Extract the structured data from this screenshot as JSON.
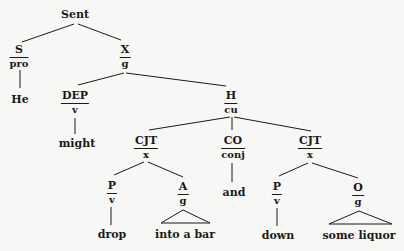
{
  "tree": {
    "root": "Sent",
    "nodes": {
      "s": {
        "function": "S",
        "category": "pro",
        "word": "He"
      },
      "x": {
        "function": "X",
        "category": "g"
      },
      "dep": {
        "function": "DEP",
        "category": "v",
        "word": "might"
      },
      "h": {
        "function": "H",
        "category": "cu"
      },
      "cjt1": {
        "function": "CJT",
        "category": "x"
      },
      "co": {
        "function": "CO",
        "category": "conj",
        "word": "and"
      },
      "cjt2": {
        "function": "CJT",
        "category": "x"
      },
      "p1": {
        "function": "P",
        "category": "v",
        "word": "drop"
      },
      "a": {
        "function": "A",
        "category": "g",
        "phrase": "into a bar"
      },
      "p2": {
        "function": "P",
        "category": "v",
        "word": "down"
      },
      "o": {
        "function": "O",
        "category": "g",
        "phrase": "some liquor"
      }
    }
  },
  "colors": {
    "line": "#1a1a1a",
    "background": "#f7f7f5"
  }
}
